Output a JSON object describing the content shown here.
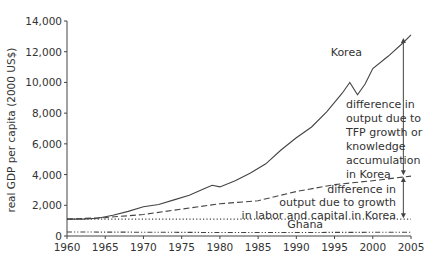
{
  "chart_data": {
    "type": "line",
    "title": "",
    "xlabel": "",
    "ylabel": "real GDP per capita (2000 US$)",
    "xlim": [
      1960,
      2005
    ],
    "ylim": [
      0,
      14000
    ],
    "x_ticks": [
      1960,
      1965,
      1970,
      1975,
      1980,
      1985,
      1990,
      1995,
      2000,
      2005
    ],
    "x_tick_labels": [
      "1960",
      "1965",
      "1970",
      "1975",
      "1980",
      "1985",
      "1990",
      "1995",
      "2000",
      "2005"
    ],
    "y_ticks": [
      0,
      2000,
      4000,
      6000,
      8000,
      10000,
      12000,
      14000
    ],
    "y_tick_labels": [
      "0",
      "2,000",
      "4,000",
      "6,000",
      "8,000",
      "10,000",
      "12,000",
      "14,000"
    ],
    "grid": false,
    "legend": "none (inline labels)",
    "series": [
      {
        "name": "Korea",
        "style": "solid",
        "x": [
          1960,
          1962,
          1964,
          1966,
          1968,
          1970,
          1972,
          1974,
          1976,
          1978,
          1979,
          1980,
          1982,
          1984,
          1986,
          1988,
          1990,
          1992,
          1994,
          1996,
          1997,
          1998,
          1999,
          2000,
          2002,
          2004,
          2005
        ],
        "values": [
          1100,
          1100,
          1150,
          1350,
          1600,
          1900,
          2050,
          2350,
          2650,
          3100,
          3300,
          3200,
          3600,
          4100,
          4700,
          5600,
          6400,
          7100,
          8100,
          9300,
          10000,
          9200,
          9900,
          10900,
          11700,
          12600,
          13100
        ]
      },
      {
        "name": "Korea (growth in labor and capital only)",
        "style": "dashed",
        "x": [
          1960,
          1965,
          1970,
          1975,
          1980,
          1985,
          1990,
          1995,
          2000,
          2005
        ],
        "values": [
          1100,
          1200,
          1400,
          1750,
          2100,
          2300,
          2900,
          3350,
          3600,
          3900
        ]
      },
      {
        "name": "Korea 1960 level",
        "style": "dotted",
        "x": [
          1960,
          2005
        ],
        "values": [
          1100,
          1100
        ]
      },
      {
        "name": "Ghana",
        "style": "dash-dot-dot",
        "x": [
          1960,
          1970,
          1980,
          1990,
          2000,
          2005
        ],
        "values": [
          260,
          250,
          230,
          230,
          240,
          250
        ]
      }
    ],
    "annotations": [
      {
        "text": "Korea",
        "x": 1996,
        "y": 12100
      },
      {
        "text": "difference in output due to TFP growth or knowledge accumulation in Korea",
        "arrow_x": 2004,
        "from": 3900,
        "to": 13100
      },
      {
        "text": "difference in output due to growth in labor and capital in Korea",
        "arrow_x": 2004,
        "from": 1100,
        "to": 3900
      },
      {
        "text": "Ghana",
        "x": 1989,
        "y": 400
      }
    ]
  },
  "labels": {
    "ylabel": "real GDP per capita (2000 US$)",
    "korea": "Korea",
    "ghana": "Ghana",
    "tfp_lines": [
      "difference in",
      "output due to",
      "TFP growth or",
      "knowledge",
      "accumulation",
      "in Korea"
    ],
    "lk_lines": [
      "difference in",
      "output due to growth",
      "in labor and capital in Korea"
    ]
  },
  "colors": {
    "line": "#444444",
    "text": "#333333",
    "background": "#ffffff"
  }
}
